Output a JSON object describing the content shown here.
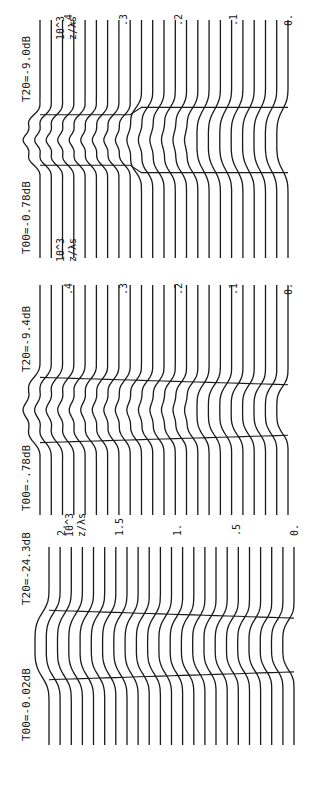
{
  "chart_data": {
    "type": "line",
    "orientation": "rotated-90-ccw",
    "panels": [
      {
        "id": "panel-1",
        "labels": {
          "t00": "T00=-0.02dB",
          "t20": "T20=-24.3dB"
        },
        "axis": {
          "label": "z/λs",
          "scale": "10^3",
          "ticks": [
            "2.",
            "1.5",
            "1.",
            ".5",
            "0."
          ],
          "tick_values": [
            2.0,
            1.5,
            1.0,
            0.5,
            0.0
          ],
          "range": [
            0,
            2.1
          ]
        },
        "num_curves": 23,
        "core_shape": "smooth-bump",
        "core_width_start": 1.0,
        "core_width_end": 0.5,
        "ripple": 0,
        "step_at": null
      },
      {
        "id": "panel-2",
        "labels": {
          "t00": "T00=-.78dB",
          "t20": "T20=-9.4dB"
        },
        "axis": {
          "label": "z/λs",
          "scale": "10^3",
          "ticks": [
            ".4",
            ".3",
            ".2",
            ".1",
            "0."
          ],
          "tick_values": [
            0.4,
            0.3,
            0.2,
            0.1,
            0.0
          ],
          "range": [
            0,
            0.45
          ]
        },
        "num_curves": 23,
        "core_shape": "bump-with-ripple",
        "core_width_start": 1.0,
        "core_width_end": 0.5,
        "ripple": 1,
        "step_at": null
      },
      {
        "id": "panel-3",
        "labels": {
          "t00": "T00=-0.78dB",
          "t20": "T20=-9.0dB"
        },
        "axis": {
          "label": "z/λs",
          "scale": "10^3",
          "ticks": [
            ".4",
            ".3",
            ".2",
            ".1",
            "0."
          ],
          "tick_values": [
            0.4,
            0.3,
            0.2,
            0.1,
            0.0
          ],
          "range": [
            0,
            0.45
          ]
        },
        "num_curves": 23,
        "core_shape": "stepped-bump-with-ripple",
        "core_width_start": 0.5,
        "core_width_end": 1.0,
        "ripple": 1,
        "step_at": 0.28
      }
    ],
    "grid": false,
    "legend": null
  },
  "colors": {
    "ink": "#1a1a1a",
    "background": "#ffffff"
  }
}
